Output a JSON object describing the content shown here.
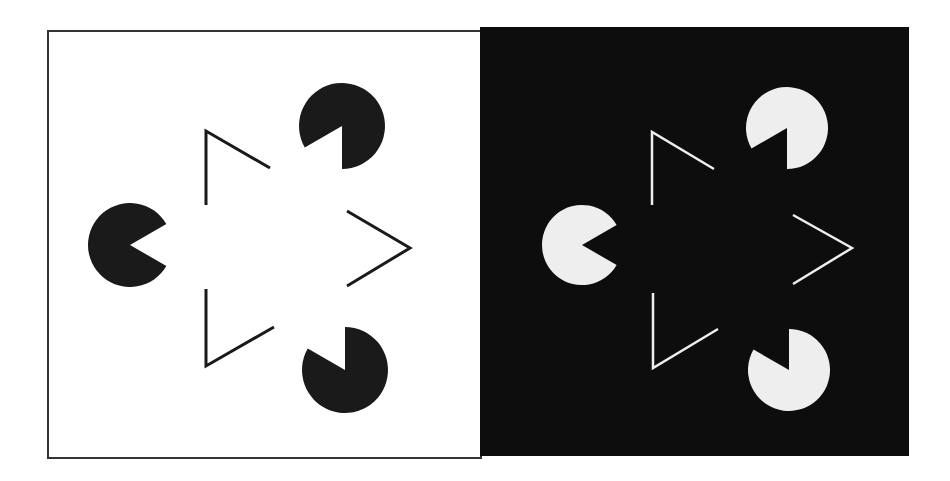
{
  "figure": {
    "panels": [
      {
        "name": "light-panel",
        "background": "#ffffff",
        "foreground": "#1a1a1a",
        "frame": {
          "x": 48,
          "y": 31,
          "w": 433,
          "h": 427,
          "stroke": "#333333"
        },
        "pacmen": [
          {
            "cx": 130,
            "cy": 245,
            "r": 42,
            "mouth_from": -30,
            "mouth_to": 30
          },
          {
            "cx": 342,
            "cy": 126,
            "r": 43,
            "mouth_from": 90,
            "mouth_to": 150
          },
          {
            "cx": 345,
            "cy": 370,
            "r": 43,
            "mouth_from": 210,
            "mouth_to": 270
          }
        ],
        "corners": [
          {
            "points": "206,205 206,131 270,168"
          },
          {
            "points": "206,289 206,366 274,327"
          },
          {
            "points": "347,211 410,248 347,286"
          }
        ],
        "line_width": 3
      },
      {
        "name": "dark-panel",
        "background": "#0d0d0d",
        "foreground": "#eeeeee",
        "frame": {
          "x": 481,
          "y": 28,
          "w": 427,
          "h": 427,
          "stroke": "#0d0d0d"
        },
        "pacmen": [
          {
            "cx": 582,
            "cy": 245,
            "r": 40,
            "mouth_from": -30,
            "mouth_to": 30
          },
          {
            "cx": 787,
            "cy": 128,
            "r": 41,
            "mouth_from": 90,
            "mouth_to": 150
          },
          {
            "cx": 789,
            "cy": 370,
            "r": 41,
            "mouth_from": 210,
            "mouth_to": 270
          }
        ],
        "corners": [
          {
            "points": "652,205 652,132 714,169"
          },
          {
            "points": "653,293 653,368 718,329"
          },
          {
            "points": "793,215 852,248 793,284"
          }
        ],
        "line_width": 2.5
      }
    ]
  }
}
